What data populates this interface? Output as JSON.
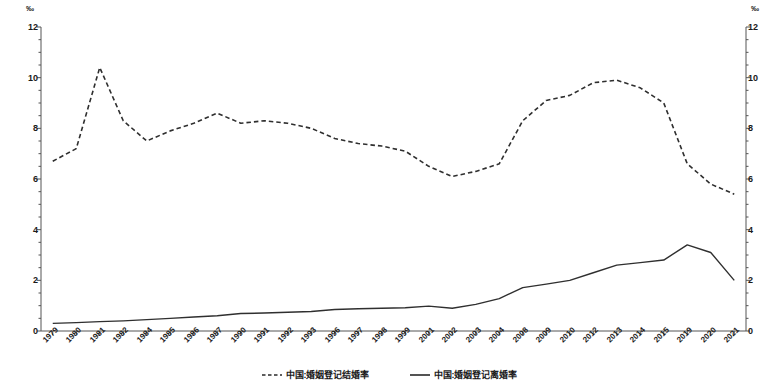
{
  "axes": {
    "unit_left": "‰",
    "unit_right": "‰",
    "y_ticks": [
      "12",
      "10",
      "8",
      "6",
      "4",
      "2",
      "0"
    ],
    "y_min": 0,
    "y_max": 12,
    "y_minor_step": 0.5
  },
  "legend": {
    "items": [
      {
        "label": "中国:婚姻登记结婚率",
        "style": "dashed",
        "color": "#2a2a2a"
      },
      {
        "label": "中国:婚姻登记离婚率",
        "style": "solid",
        "color": "#2a2a2a"
      }
    ]
  },
  "chart_data": {
    "type": "line",
    "title": "",
    "xlabel": "",
    "ylabel": "‰",
    "ylim": [
      0,
      12
    ],
    "grid": false,
    "legend_position": "bottom",
    "categories": [
      "1979",
      "1980",
      "1981",
      "1982",
      "1984",
      "1985",
      "1986",
      "1987",
      "1990",
      "1991",
      "1992",
      "1993",
      "1996",
      "1997",
      "1998",
      "1999",
      "2001",
      "2002",
      "2003",
      "2004",
      "2008",
      "2009",
      "2010",
      "2012",
      "2013",
      "2014",
      "2015",
      "2019",
      "2020",
      "2021"
    ],
    "series": [
      {
        "name": "中国:婚姻登记结婚率",
        "style": "dashed",
        "values": [
          6.7,
          7.2,
          10.4,
          8.3,
          7.5,
          7.9,
          8.2,
          8.6,
          8.2,
          8.3,
          8.2,
          8.0,
          7.6,
          7.4,
          7.3,
          7.1,
          6.5,
          6.1,
          6.3,
          6.6,
          8.3,
          9.1,
          9.3,
          9.8,
          9.9,
          9.6,
          9.0,
          6.6,
          5.8,
          5.4
        ]
      },
      {
        "name": "中国:婚姻登记离婚率",
        "style": "solid",
        "values": [
          0.3,
          0.33,
          0.37,
          0.4,
          0.45,
          0.5,
          0.55,
          0.6,
          0.69,
          0.71,
          0.74,
          0.77,
          0.85,
          0.88,
          0.9,
          0.92,
          0.98,
          0.9,
          1.05,
          1.28,
          1.71,
          1.85,
          2.0,
          2.3,
          2.6,
          2.7,
          2.8,
          3.4,
          3.1,
          2.0
        ]
      }
    ]
  }
}
